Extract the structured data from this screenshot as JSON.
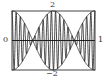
{
  "chart_data": {
    "type": "line",
    "title": "",
    "xlabel": "",
    "ylabel": "",
    "xlim": [
      0,
      1
    ],
    "ylim": [
      -2,
      2
    ],
    "tick_labels": {
      "left": "0",
      "right": "1",
      "top": "2",
      "bottom": "−2"
    },
    "grid": false,
    "series": [
      {
        "name": "upper envelope",
        "expr": "2cos(2πt)"
      },
      {
        "name": "lower envelope",
        "expr": "-2cos(2πt)"
      },
      {
        "name": "signal",
        "expr": "2cos(2πt)·sin(2π·20t)"
      }
    ],
    "envelope_amplitude": 2,
    "envelope_frequency": 1,
    "carrier_frequency": 20
  },
  "labels": {
    "top": "2",
    "bottom": "−2",
    "left": "0",
    "right": "1"
  }
}
